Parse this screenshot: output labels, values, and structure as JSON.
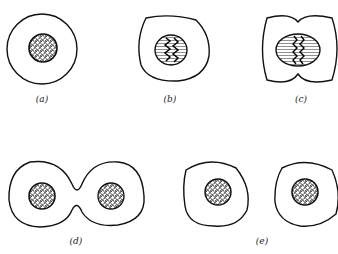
{
  "figure": {
    "panels": [
      {
        "id": "a",
        "label": "(a)",
        "stage": "interphase cell with granular nucleus"
      },
      {
        "id": "b",
        "label": "(b)",
        "stage": "nucleus with zigzag chromosomes"
      },
      {
        "id": "c",
        "label": "(c)",
        "stage": "constricting cell with spindle nucleus"
      },
      {
        "id": "d",
        "label": "(d)",
        "stage": "dividing cell with two nuclei"
      },
      {
        "id": "e",
        "label": "(e)",
        "stage": "two daughter cells"
      }
    ]
  }
}
